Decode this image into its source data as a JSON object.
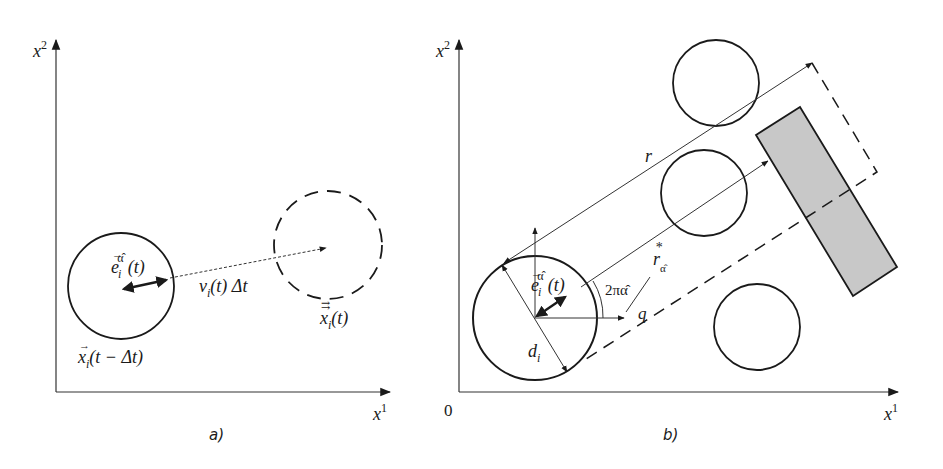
{
  "panel_a": {
    "caption": "a)",
    "axis_x_label": "x",
    "axis_x_sup": "1",
    "axis_y_label": "x",
    "axis_y_sup": "2",
    "direction_label": "e",
    "direction_sub": "i",
    "direction_sup": "α̂",
    "direction_arg": "(t)",
    "displacement_label": "v",
    "displacement_sub": "i",
    "displacement_rest": "(t) Δt",
    "old_position_label": "x",
    "old_position_sub": "i",
    "old_position_arg": "(t − Δt)",
    "new_position_label": "x",
    "new_position_sub": "i",
    "new_position_arg": "(t)"
  },
  "panel_b": {
    "caption": "b)",
    "origin_label": "0",
    "axis_x_label": "x",
    "axis_x_sup": "1",
    "axis_y_label": "x",
    "axis_y_sup": "2",
    "range_label": "r",
    "free_range_label": "r",
    "free_range_sub": "α̂",
    "free_range_sup": "*",
    "direction_label": "e",
    "direction_sub": "i",
    "direction_sup": "α̂",
    "direction_arg": "(t)",
    "angle_label": "2πα̂",
    "q_label": "q",
    "diameter_label": "d",
    "diameter_sub": "i"
  },
  "colors": {
    "stroke": "#1a1a1a",
    "thin_stroke": "#333333",
    "obstacle_fill": "#c8c8c8"
  }
}
